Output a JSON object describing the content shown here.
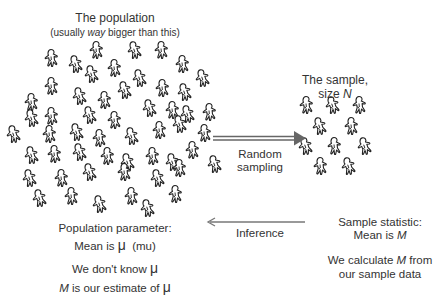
{
  "population": {
    "title": "The population",
    "subtitle_pre": "(usually ",
    "subtitle_em": "way",
    "subtitle_post": " bigger than this)",
    "figure_icon": "person-figure-icon",
    "figures": [
      [
        52,
        58
      ],
      [
        76,
        64
      ],
      [
        97,
        50
      ],
      [
        135,
        50
      ],
      [
        162,
        50
      ],
      [
        92,
        74
      ],
      [
        115,
        68
      ],
      [
        140,
        78
      ],
      [
        183,
        64
      ],
      [
        203,
        78
      ],
      [
        52,
        86
      ],
      [
        125,
        90
      ],
      [
        163,
        88
      ],
      [
        185,
        92
      ],
      [
        32,
        102
      ],
      [
        80,
        96
      ],
      [
        105,
        100
      ],
      [
        188,
        114
      ],
      [
        210,
        112
      ],
      [
        32,
        118
      ],
      [
        52,
        116
      ],
      [
        90,
        115
      ],
      [
        115,
        120
      ],
      [
        150,
        108
      ],
      [
        173,
        110
      ],
      [
        14,
        134
      ],
      [
        50,
        134
      ],
      [
        77,
        132
      ],
      [
        100,
        138
      ],
      [
        132,
        136
      ],
      [
        160,
        130
      ],
      [
        180,
        124
      ],
      [
        205,
        133
      ],
      [
        32,
        155
      ],
      [
        55,
        154
      ],
      [
        80,
        152
      ],
      [
        108,
        156
      ],
      [
        128,
        162
      ],
      [
        153,
        156
      ],
      [
        173,
        162
      ],
      [
        193,
        150
      ],
      [
        30,
        178
      ],
      [
        62,
        178
      ],
      [
        90,
        172
      ],
      [
        125,
        172
      ],
      [
        158,
        178
      ],
      [
        180,
        168
      ],
      [
        40,
        198
      ],
      [
        72,
        196
      ],
      [
        100,
        204
      ],
      [
        132,
        196
      ],
      [
        148,
        208
      ],
      [
        176,
        194
      ],
      [
        215,
        164
      ]
    ]
  },
  "sample": {
    "title": "The sample,",
    "size_pre": "size ",
    "size_var": "N",
    "figures": [
      [
        307,
        105
      ],
      [
        333,
        105
      ],
      [
        360,
        105
      ],
      [
        320,
        126
      ],
      [
        352,
        126
      ],
      [
        306,
        146
      ],
      [
        335,
        146
      ],
      [
        365,
        146
      ],
      [
        321,
        166
      ],
      [
        349,
        166
      ]
    ]
  },
  "arrows": {
    "random_sampling": {
      "line1": "Random",
      "line2": "sampling",
      "direction": "right",
      "style": "double-line"
    },
    "inference": {
      "label": "Inference",
      "direction": "left",
      "style": "single-line"
    }
  },
  "population_parameter": {
    "line1": "Population parameter:",
    "line2_pre": "Mean is ",
    "line2_symbol": "μ",
    "line2_post": "  (mu)",
    "line3_pre": "We don't know ",
    "line3_symbol": "μ",
    "line4_var": "M",
    "line4_mid": " is our estimate of ",
    "line4_symbol": "μ"
  },
  "sample_statistic": {
    "line1": "Sample statistic:",
    "line2_pre": "Mean is ",
    "line2_var": "M",
    "line3_pre": "We calculate ",
    "line3_var": "M",
    "line3_post": " from",
    "line4": "our sample data"
  },
  "colors": {
    "text": "#333333",
    "figure_stroke": "#222222",
    "arrow": "#666666"
  }
}
